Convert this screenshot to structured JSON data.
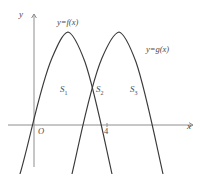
{
  "figure": {
    "type": "math-diagram",
    "background_color": "#ffffff",
    "curve_color": "#3a3a3a",
    "axis_color": "#8e8e8e",
    "text_color": "#4a4a4a"
  },
  "axes": {
    "x_label": "x",
    "y_label": "y",
    "origin_label": "O",
    "x_ticks": [
      {
        "label": "4",
        "x_px": 107
      }
    ],
    "origin_px": {
      "x": 34,
      "y": 125
    },
    "x_axis_y_px": 125,
    "y_axis_x_px": 34
  },
  "curves": [
    {
      "name": "f",
      "label": "y=f(x)",
      "label_px": {
        "x": 57,
        "y": 18
      },
      "opens": "down",
      "vertex_px": {
        "x": 68,
        "y": 32
      },
      "x_intercepts_px": [
        34,
        101
      ],
      "path": "M 20,174 C 30,140 40,86 52,58 C 58,44 63,33 68,32 C 73,33 79,46 85,62 C 94,88 104,138 112,174"
    },
    {
      "name": "g",
      "label": "y=g(x)",
      "label_px": {
        "x": 146,
        "y": 45
      },
      "opens": "down",
      "vertex_px": {
        "x": 119,
        "y": 32
      },
      "x_intercepts_px": [
        86,
        152
      ],
      "path": "M 72,174 C 80,140 90,86 102,58 C 108,44 114,33 119,32 C 124,33 130,46 136,62 C 145,88 155,138 163,174"
    }
  ],
  "regions": [
    {
      "label": "S",
      "subscript": "1",
      "px": {
        "x": 60,
        "y": 85
      }
    },
    {
      "label": "S",
      "subscript": "2",
      "px": {
        "x": 96,
        "y": 85
      }
    },
    {
      "label": "S",
      "subscript": "3",
      "px": {
        "x": 130,
        "y": 85
      }
    }
  ]
}
